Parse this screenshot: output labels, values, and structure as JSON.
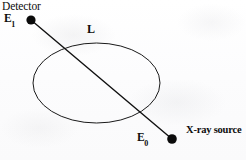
{
  "figure": {
    "kind": "x-ray-attenuation-schematic",
    "width": 246,
    "height": 160,
    "background_color": "#fdfdfd",
    "ink_color": "#111111"
  },
  "labels": {
    "detector": "Detector",
    "transmitted_energy": "E",
    "transmitted_energy_subscript": "1",
    "incident_energy": "E",
    "incident_energy_subscript": "0",
    "path_length": "L",
    "source": "X-ray source"
  },
  "geometry": {
    "ellipse": {
      "center_x": 96.5,
      "center_y": 83,
      "radius_x": 63.5,
      "radius_y": 40,
      "stroke_width": 1,
      "fill": "none",
      "stroke": "#1a1a1a"
    },
    "beam": {
      "x1": 31,
      "y1": 20,
      "x2": 172,
      "y2": 139,
      "stroke_width": 1.4,
      "stroke": "#111111"
    },
    "detector_dot": {
      "cx": 31,
      "cy": 20,
      "r": 4.6,
      "fill": "#0b0b0b"
    },
    "source_dot": {
      "cx": 172,
      "cy": 139,
      "r": 4.8,
      "fill": "#0b0b0b"
    }
  }
}
